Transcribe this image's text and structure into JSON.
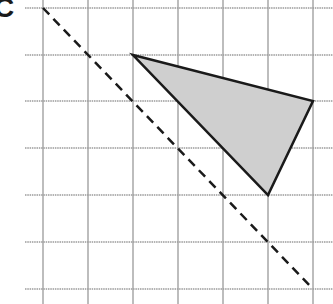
{
  "figure": {
    "label": "C",
    "grid": {
      "x_lines": [
        43,
        88,
        133,
        178,
        223,
        268,
        313
      ],
      "y_lines": [
        8,
        55,
        101,
        148,
        195,
        242,
        289
      ],
      "x_start": 25,
      "x_end": 333,
      "y_start": 0,
      "y_end": 304,
      "color": "#9a9a9a"
    },
    "triangle": {
      "points": [
        [
          133,
          55
        ],
        [
          313,
          101
        ],
        [
          268,
          195
        ]
      ],
      "fill": "#cfcfcf",
      "stroke": "#1a1a1a"
    },
    "mirror_line": {
      "from": [
        43,
        8
      ],
      "to": [
        313,
        289
      ],
      "style": "dashed",
      "stroke": "#1a1a1a"
    }
  }
}
